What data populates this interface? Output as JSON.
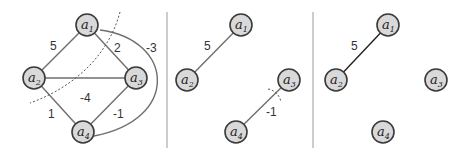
{
  "panels": [
    {
      "id": "full-graph",
      "nodes": [
        {
          "name": "a",
          "sub": "1"
        },
        {
          "name": "a",
          "sub": "2"
        },
        {
          "name": "a",
          "sub": "3"
        },
        {
          "name": "a",
          "sub": "4"
        }
      ],
      "edges": [
        {
          "from": "a1",
          "to": "a2",
          "weight": "5"
        },
        {
          "from": "a1",
          "to": "a3",
          "weight": "2"
        },
        {
          "from": "a1",
          "to": "a4",
          "weight": "-3"
        },
        {
          "from": "a2",
          "to": "a3",
          "weight": "-4"
        },
        {
          "from": "a2",
          "to": "a4",
          "weight": "1"
        },
        {
          "from": "a3",
          "to": "a4",
          "weight": "-1"
        }
      ]
    },
    {
      "id": "partial-graph",
      "nodes": [
        {
          "name": "a",
          "sub": "1"
        },
        {
          "name": "a",
          "sub": "2"
        },
        {
          "name": "a",
          "sub": "3"
        },
        {
          "name": "a",
          "sub": "4"
        }
      ],
      "edges": [
        {
          "from": "a1",
          "to": "a2",
          "weight": "5"
        },
        {
          "from": "a3",
          "to": "a4",
          "weight": "-1"
        }
      ]
    },
    {
      "id": "final-graph",
      "nodes": [
        {
          "name": "a",
          "sub": "1"
        },
        {
          "name": "a",
          "sub": "2"
        },
        {
          "name": "a",
          "sub": "3"
        },
        {
          "name": "a",
          "sub": "4"
        }
      ],
      "edges": [
        {
          "from": "a1",
          "to": "a2",
          "weight": "5"
        }
      ]
    }
  ]
}
